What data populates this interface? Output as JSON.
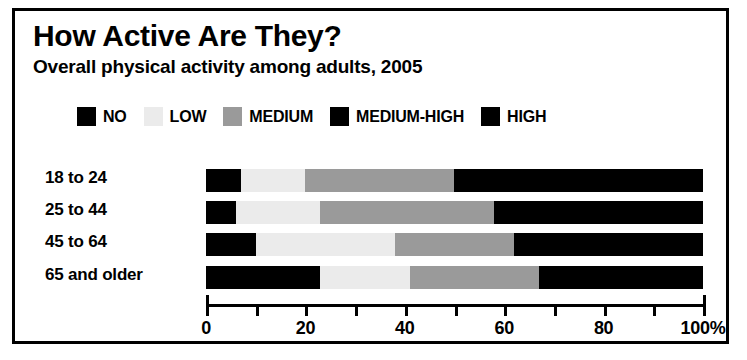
{
  "chart_data": {
    "type": "bar",
    "orientation": "horizontal",
    "stacked": true,
    "normalized_percent": true,
    "title": "How Active Are They?",
    "subtitle": "Overall physical activity among adults, 2005",
    "xlabel": "",
    "ylabel": "",
    "xlim": [
      0,
      100
    ],
    "grid": false,
    "legend_position": "top",
    "axis_unit_suffix": "%",
    "categories": [
      "18 to 24",
      "25 to 44",
      "45 to 64",
      "65 and older"
    ],
    "tick_values": [
      0,
      10,
      20,
      30,
      40,
      50,
      60,
      70,
      80,
      90,
      100
    ],
    "tick_labels": [
      {
        "value": 0,
        "label": "0"
      },
      {
        "value": 20,
        "label": "20"
      },
      {
        "value": 40,
        "label": "40"
      },
      {
        "value": 60,
        "label": "60"
      },
      {
        "value": 80,
        "label": "80"
      },
      {
        "value": 100,
        "label": "100%"
      }
    ],
    "series": [
      {
        "name": "NO",
        "color": "#000000",
        "values": [
          7,
          6,
          10,
          23
        ]
      },
      {
        "name": "LOW",
        "color": "#ebebeb",
        "values": [
          13,
          17,
          28,
          18
        ]
      },
      {
        "name": "MEDIUM",
        "color": "#9a9a9a",
        "values": [
          30,
          35,
          24,
          26
        ]
      },
      {
        "name": "MEDIUM-HIGH",
        "color": "#000000",
        "values": [
          25,
          21,
          19,
          17
        ]
      },
      {
        "name": "HIGH",
        "color": "#000000",
        "values": [
          25,
          21,
          19,
          16
        ]
      }
    ]
  },
  "legend": {
    "items": [
      {
        "label": "NO",
        "color": "#000000"
      },
      {
        "label": "LOW",
        "color": "#ebebeb"
      },
      {
        "label": "MEDIUM",
        "color": "#9a9a9a"
      },
      {
        "label": "MEDIUM-HIGH",
        "color": "#000000"
      },
      {
        "label": "HIGH",
        "color": "#000000"
      }
    ]
  },
  "colors": {
    "frame": "#000000",
    "background": "#ffffff",
    "text": "#000000"
  }
}
